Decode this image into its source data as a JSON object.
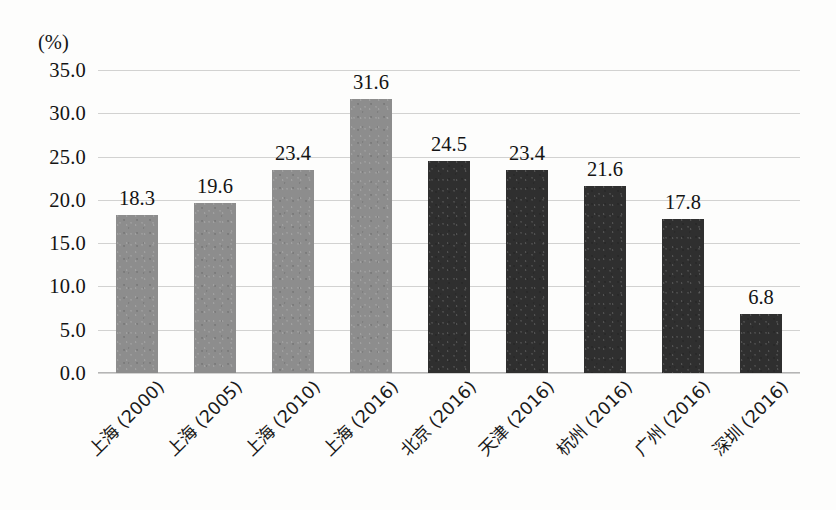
{
  "chart_data": {
    "type": "bar",
    "title": "",
    "xlabel": "",
    "ylabel": "(%)",
    "unit_label": "(%)",
    "categories": [
      "上海 (2000)",
      "上海 (2005)",
      "上海 (2010)",
      "上海 (2016)",
      "北京 (2016)",
      "天津 (2016)",
      "杭州 (2016)",
      "广州 (2016)",
      "深圳 (2016)"
    ],
    "values": [
      18.3,
      19.6,
      23.4,
      31.6,
      24.5,
      23.4,
      21.6,
      17.8,
      6.8
    ],
    "value_labels": [
      "18.3",
      "19.6",
      "23.4",
      "31.6",
      "24.5",
      "23.4",
      "21.6",
      "17.8",
      "6.8"
    ],
    "bar_colors": [
      "#8d8d8d",
      "#8d8d8d",
      "#8d8d8d",
      "#8d8d8d",
      "#2f2f2f",
      "#2f2f2f",
      "#2f2f2f",
      "#2f2f2f",
      "#2f2f2f"
    ],
    "bar_styles": [
      "light",
      "light",
      "light",
      "light",
      "dark",
      "dark",
      "dark",
      "dark",
      "dark"
    ],
    "ylim": [
      0,
      35
    ],
    "ytick_step": 5,
    "ytick_labels": [
      "0.0",
      "5.0",
      "10.0",
      "15.0",
      "20.0",
      "25.0",
      "30.0",
      "35.0"
    ],
    "ytick_values": [
      0,
      5,
      10,
      15,
      20,
      25,
      30,
      35
    ],
    "grid": true,
    "grid_orientation": "horizontal",
    "grid_color": "#c3c3c3",
    "legend": false,
    "legend_position": "none",
    "background_color": "#fdfdfc",
    "text_color": "#141414"
  }
}
